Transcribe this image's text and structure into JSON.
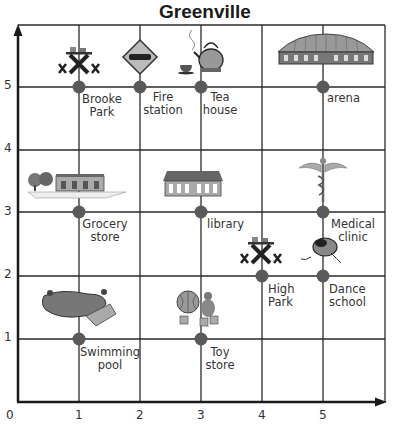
{
  "title": "Greenville",
  "axes": {
    "x_ticks": [
      "0",
      "1",
      "2",
      "3",
      "4",
      "5"
    ],
    "y_ticks": [
      "1",
      "2",
      "3",
      "4",
      "5"
    ]
  },
  "locations": [
    {
      "id": "brooke-park",
      "line1": "Brooke",
      "line2": "Park",
      "x": 1,
      "y": 5,
      "icon": "picnic-table-icon"
    },
    {
      "id": "fire-station",
      "line1": "Fire",
      "line2": "station",
      "x": 2,
      "y": 5,
      "icon": "fire-truck-sign-icon"
    },
    {
      "id": "tea-house",
      "line1": "Tea",
      "line2": "house",
      "x": 3,
      "y": 5,
      "icon": "teapot-icon"
    },
    {
      "id": "arena",
      "line1": "arena",
      "line2": "",
      "x": 5,
      "y": 5,
      "icon": "arena-icon"
    },
    {
      "id": "grocery-store",
      "line1": "Grocery",
      "line2": "store",
      "x": 1,
      "y": 3,
      "icon": "grocery-store-icon"
    },
    {
      "id": "library",
      "line1": "library",
      "line2": "",
      "x": 3,
      "y": 3,
      "icon": "library-icon"
    },
    {
      "id": "medical-clinic",
      "line1": "Medical",
      "line2": "clinic",
      "x": 5,
      "y": 3,
      "icon": "caduceus-icon"
    },
    {
      "id": "high-park",
      "line1": "High",
      "line2": "Park",
      "x": 4,
      "y": 2,
      "icon": "picnic-table-icon"
    },
    {
      "id": "dance-school",
      "line1": "Dance",
      "line2": "school",
      "x": 5,
      "y": 2,
      "icon": "ballet-shoes-icon"
    },
    {
      "id": "swimming-pool",
      "line1": "Swimming",
      "line2": "pool",
      "x": 1,
      "y": 1,
      "icon": "pool-icon"
    },
    {
      "id": "toy-store",
      "line1": "Toy",
      "line2": "store",
      "x": 3,
      "y": 1,
      "icon": "toys-icon"
    }
  ],
  "colors": {
    "grid": "#2a2a2a",
    "dot": "#5a5a5a"
  }
}
